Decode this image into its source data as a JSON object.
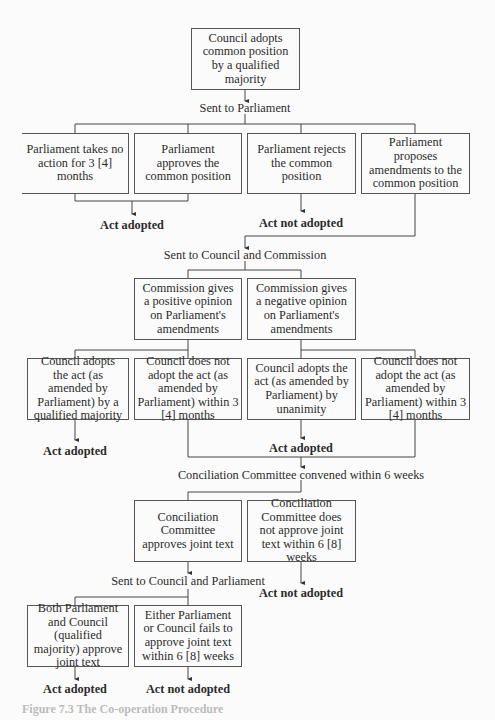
{
  "diagram": {
    "start": "Council adopts common position by a qualified majority",
    "sent_to_parliament": "Sent to Parliament",
    "parliament_options": [
      "Parliament takes no action for 3 [4] months",
      "Parliament approves the common position",
      "Parliament rejects the common position",
      "Parliament proposes amendments to the common position"
    ],
    "outcome_act_adopted_1": "Act adopted",
    "outcome_act_not_adopted_1": "Act not adopted",
    "sent_to_council_commission": "Sent to Council and Commission",
    "commission_opinions": [
      "Commission gives a positive opinion on Parliament's amendments",
      "Commission gives a negative opinion on Parliament's amendments"
    ],
    "council_decisions": [
      "Council adopts the act (as amended by Parliament) by a qualified majority",
      "Council does not adopt the act (as amended by Parliament) within 3 [4] months",
      "Council adopts the act (as amended by Parliament) by unanimity",
      "Council does not adopt the act (as amended by Parliament) within 3 [4] months"
    ],
    "outcome_act_adopted_2": "Act adopted",
    "outcome_act_adopted_3": "Act adopted",
    "conciliation_convened": "Conciliation Committee convened within 6 weeks",
    "conciliation_results": [
      "Conciliation Committee approves joint text",
      "Conciliation Committee does not approve joint text within 6 [8] weeks"
    ],
    "outcome_act_not_adopted_2": "Act not adopted",
    "sent_to_council_parliament": "Sent to Council and Parliament",
    "final_votes": [
      "Both Parliament and Council (qualified majority) approve joint text",
      "Either Parliament or Council fails to approve joint text within 6 [8] weeks"
    ],
    "outcome_act_adopted_4": "Act adopted",
    "outcome_act_not_adopted_3": "Act not adopted",
    "caption": "Figure 7.3 The Co-operation Procedure"
  }
}
